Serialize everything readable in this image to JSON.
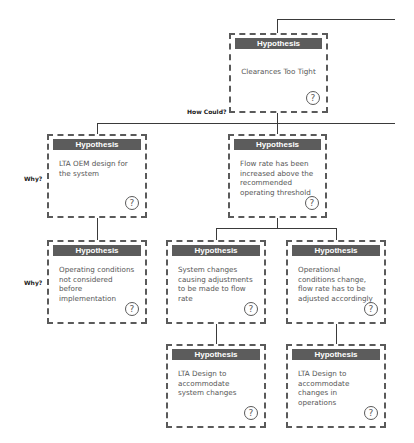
{
  "labels": {
    "how_could": "How Could?",
    "why_1": "Why?",
    "why_2": "Why?"
  },
  "nodes": [
    {
      "header": "Hypothesis",
      "text": "Clearances Too Tight",
      "icon": "question-circle-icon"
    },
    {
      "header": "Hypothesis",
      "text": "LTA OEM design for the system",
      "icon": "question-circle-icon"
    },
    {
      "header": "Hypothesis",
      "text": "Flow rate has been increased above the recommended operating threshold",
      "icon": "question-circle-icon"
    },
    {
      "header": "Hypothesis",
      "text": "Operating conditions not considered before implementation",
      "icon": "question-circle-icon"
    },
    {
      "header": "Hypothesis",
      "text": "System changes causing adjustments to be made to flow rate",
      "icon": "question-circle-icon"
    },
    {
      "header": "Hypothesis",
      "text": "Operational conditions change, flow rate has to be adjusted accordingly",
      "icon": "question-circle-icon"
    },
    {
      "header": "Hypothesis",
      "text": "LTA Design to accommodate system changes",
      "icon": "question-circle-icon"
    },
    {
      "header": "Hypothesis",
      "text": "LTA Design to accommodate changes in operations",
      "icon": "question-circle-icon"
    }
  ],
  "question_glyph": "?",
  "colors": {
    "header_bg": "#5c5c5c",
    "border": "#5a5a5a",
    "line": "#3a3a3a",
    "text": "#555555"
  }
}
